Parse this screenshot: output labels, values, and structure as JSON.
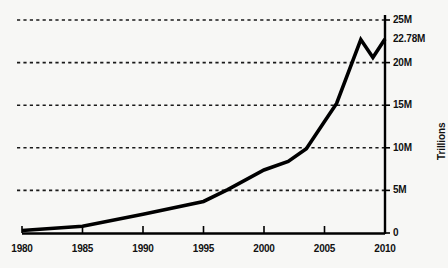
{
  "chart_data": {
    "type": "line",
    "title": "",
    "subtitle": "",
    "xlabel": "",
    "ylabel": "Trillions",
    "xlim": [
      1979,
      2010.4
    ],
    "ylim": [
      0,
      25
    ],
    "grid": true,
    "legend": null,
    "y_unit": "M",
    "x_ticks": [
      1980,
      1985,
      1990,
      1995,
      2000,
      2005,
      2010
    ],
    "x_tick_labels": [
      "1980",
      "1985",
      "1990",
      "1995",
      "2000",
      "2005",
      "2010"
    ],
    "y_ticks": [
      0,
      5,
      10,
      15,
      20,
      25
    ],
    "y_tick_labels": [
      "0",
      "5M",
      "10M",
      "15M",
      "20M",
      "25M"
    ],
    "annotations": [
      {
        "label": "22.78M",
        "value": 22.78,
        "axis": "y",
        "side": "right"
      }
    ],
    "series": [
      {
        "name": "Notional value",
        "color": "#000000",
        "x": [
          1980,
          1985,
          1990,
          1995,
          1997,
          2000,
          2002,
          2003.5,
          2005,
          2006,
          2008,
          2009,
          2010
        ],
        "values": [
          0.3,
          0.8,
          2.2,
          3.7,
          5.1,
          7.4,
          8.4,
          9.9,
          13.1,
          15.2,
          22.7,
          20.6,
          22.78
        ]
      }
    ]
  },
  "axis_labels": {
    "y": [
      {
        "text": "25M",
        "value": 25
      },
      {
        "text": "22.78M",
        "value": 22.78
      },
      {
        "text": "20M",
        "value": 20
      },
      {
        "text": "15M",
        "value": 15
      },
      {
        "text": "10M",
        "value": 10
      },
      {
        "text": "5M",
        "value": 5
      },
      {
        "text": "0",
        "value": 0
      }
    ],
    "x": [
      {
        "text": "1980",
        "value": 1980
      },
      {
        "text": "1985",
        "value": 1985
      },
      {
        "text": "1990",
        "value": 1990
      },
      {
        "text": "1995",
        "value": 1995
      },
      {
        "text": "2000",
        "value": 2000
      },
      {
        "text": "2005",
        "value": 2005
      },
      {
        "text": "2010",
        "value": 2010
      }
    ]
  },
  "colors": {
    "background": "#f7f7f5",
    "line": "#000000",
    "grid": "#1a1a1a",
    "axis": "#000000",
    "text": "#111111"
  }
}
